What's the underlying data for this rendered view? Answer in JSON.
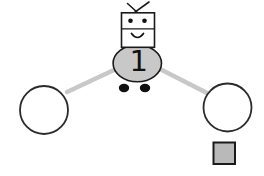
{
  "diagram": {
    "robot": {
      "number": "1"
    },
    "colors": {
      "robot_body": "#c8c8c8",
      "robot_head": "#ffffff",
      "connector": "#c8c8c8",
      "node_fill": "#ffffff",
      "square_fill": "#b9b9b9",
      "outline": "#1a1a1a",
      "background": "#ffffff"
    }
  }
}
